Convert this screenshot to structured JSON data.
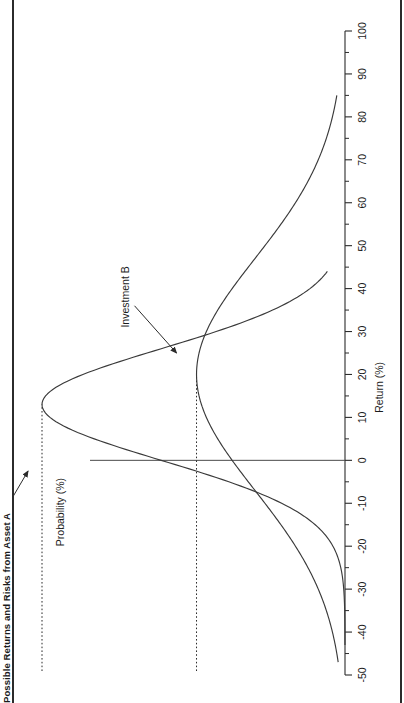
{
  "figure": {
    "title": "Possible Returns and Risks from Asset A",
    "background_color": "#ffffff",
    "line_color": "#3a3a3a",
    "frame_color": "#2b2b2b"
  },
  "axes": {
    "x_axis_title": "Return (%)",
    "y_axis_title": "Probability (%)",
    "x_tick_labels": [
      "-50",
      "-40",
      "-30",
      "-20",
      "-10",
      "0",
      "10",
      "20",
      "30",
      "40",
      "50",
      "60",
      "70",
      "80",
      "90",
      "100"
    ],
    "x_tick_values": [
      -50,
      -40,
      -30,
      -20,
      -10,
      0,
      10,
      20,
      30,
      40,
      50,
      60,
      70,
      80,
      90,
      100
    ],
    "x_minor_tick_values": [
      -45,
      -35,
      -25,
      -15,
      -5,
      5,
      15,
      25,
      35,
      45,
      55,
      65,
      75,
      85,
      95
    ],
    "x_min": -50,
    "x_max": 100
  },
  "annotations": [
    {
      "name": "investment-a",
      "label": "Investment A"
    },
    {
      "name": "investment-b",
      "label": "Investment B"
    }
  ],
  "chart_data": {
    "type": "line",
    "title": "Possible Returns and Risks from Asset A",
    "xlabel": "Return (%)",
    "ylabel": "Probability (%)",
    "xlim": [
      -50,
      100
    ],
    "ylim": [
      0,
      1
    ],
    "grid": false,
    "legend": "inline-annotations",
    "x_ticks": [
      -50,
      -40,
      -30,
      -20,
      -10,
      0,
      10,
      20,
      30,
      40,
      50,
      60,
      70,
      80,
      90,
      100
    ],
    "series": [
      {
        "name": "Investment A",
        "distribution": "normal",
        "mean": 13,
        "std_dev": 13,
        "peak_return": 13,
        "peak_probability": 1.0,
        "range_min": -43,
        "range_max": 44,
        "description": "Tall narrow distribution: lower expected return, lower risk"
      },
      {
        "name": "Investment B",
        "distribution": "normal",
        "mean": 20,
        "std_dev": 27,
        "peak_return": 20,
        "peak_probability": 0.49,
        "range_min": -47,
        "range_max": 85,
        "description": "Short wide distribution: higher expected return, higher risk"
      }
    ],
    "reference_lines": [
      {
        "name": "peak-line-a",
        "style": "dotted",
        "orientation": "horizontal-to-peak",
        "at_return": 13,
        "series": "Investment A"
      },
      {
        "name": "peak-line-b",
        "style": "dotted",
        "orientation": "horizontal-to-peak",
        "at_return": 20,
        "series": "Investment B"
      }
    ],
    "baseline": {
      "name": "zero-axis",
      "at_return": 0
    }
  }
}
